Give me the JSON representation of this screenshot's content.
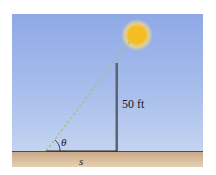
{
  "figure": {
    "type": "trigonometry-diagram",
    "labels": {
      "angle": "θ",
      "pole_height": "50 ft",
      "shadow_length": "s"
    },
    "colors": {
      "sky_top": "#8fa9e6",
      "sky_bottom": "#c3d3f1",
      "ground": "#d6b995",
      "sun": "#f7c21f",
      "sun_glow": "#fde68a",
      "pole": "#5b6470",
      "sight_line": "#9dbb6a"
    }
  }
}
